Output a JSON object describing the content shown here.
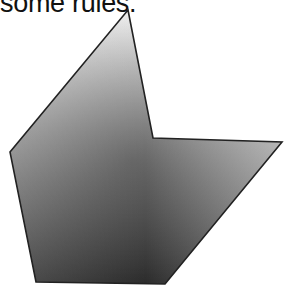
{
  "caption": "some rules.",
  "shape": {
    "name": "concave-hexagon",
    "points": [
      [
        128,
        10
      ],
      [
        153,
        138
      ],
      [
        282,
        142
      ],
      [
        165,
        284
      ],
      [
        36,
        282
      ],
      [
        10,
        152
      ]
    ],
    "stroke": "#222222",
    "gradient": {
      "light": "#f4f4f4",
      "mid": "#8a8a8a",
      "dark": "#2e2e2e"
    }
  }
}
